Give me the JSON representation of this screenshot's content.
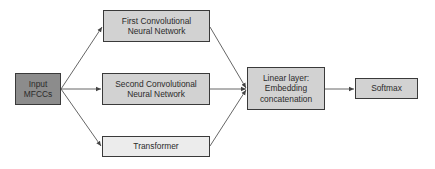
{
  "diagram": {
    "colors": {
      "input_fill": "#8c8c8c",
      "block_fill": "#d2d2d2",
      "transformer_fill": "#ececec",
      "border": "#3a3a3a",
      "edge": "#555555"
    },
    "nodes": [
      {
        "id": "input",
        "label": "Input\nMFCCs"
      },
      {
        "id": "cnn1",
        "label": "First Convolutional\nNeural Network"
      },
      {
        "id": "cnn2",
        "label": "Second Convolutional\nNeural Network"
      },
      {
        "id": "transformer",
        "label": "Transformer"
      },
      {
        "id": "linear",
        "label": "Linear layer:\nEmbedding\nconcatenation"
      },
      {
        "id": "softmax",
        "label": "Softmax"
      }
    ],
    "edges": [
      {
        "from": "input",
        "to": "cnn1"
      },
      {
        "from": "input",
        "to": "cnn2"
      },
      {
        "from": "input",
        "to": "transformer"
      },
      {
        "from": "cnn1",
        "to": "linear"
      },
      {
        "from": "cnn2",
        "to": "linear"
      },
      {
        "from": "transformer",
        "to": "linear"
      },
      {
        "from": "linear",
        "to": "softmax"
      }
    ]
  }
}
